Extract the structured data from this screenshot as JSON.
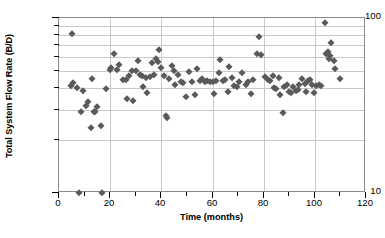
{
  "chart_data": {
    "type": "scatter",
    "title": "",
    "xlabel": "Time (months)",
    "ylabel": "Total System Flow Rate (B/D)",
    "xlim": [
      0,
      120
    ],
    "ylim": [
      10,
      100
    ],
    "yscale": "log",
    "xscale": "linear",
    "grid": true,
    "legend": null,
    "marker": {
      "shape": "diamond",
      "color": "#5a5a5a",
      "size_px": 5.4
    },
    "xticks_major": [
      0,
      20,
      40,
      60,
      80,
      100,
      120
    ],
    "xticks_minor": [
      10,
      30,
      50,
      70,
      90,
      110
    ],
    "yticks_major": [
      10,
      100
    ],
    "yticks_minor": [
      20,
      30,
      40,
      50,
      60,
      70,
      80,
      90
    ],
    "ytick_labels": [
      "10",
      "100"
    ],
    "xtick_labels": [
      "0",
      "20",
      "40",
      "60",
      "80",
      "100",
      "120"
    ],
    "series": [
      {
        "name": "Total System Flow Rate",
        "points": [
          [
            4.5,
            41.0
          ],
          [
            5.0,
            81.0
          ],
          [
            5.5,
            42.5
          ],
          [
            7.0,
            40.0
          ],
          [
            8.0,
            10.0
          ],
          [
            8.5,
            29.0
          ],
          [
            9.5,
            38.5
          ],
          [
            10.5,
            31.5
          ],
          [
            11.5,
            33.0
          ],
          [
            12.5,
            23.5
          ],
          [
            13.0,
            45.0
          ],
          [
            13.5,
            29.0
          ],
          [
            14.0,
            29.0
          ],
          [
            15.0,
            31.0
          ],
          [
            16.5,
            24.0
          ],
          [
            17.0,
            10.0
          ],
          [
            18.5,
            39.5
          ],
          [
            20.0,
            50.5
          ],
          [
            20.5,
            51.5
          ],
          [
            21.5,
            62.0
          ],
          [
            22.5,
            50.5
          ],
          [
            23.5,
            54.0
          ],
          [
            25.0,
            44.5
          ],
          [
            26.0,
            44.0
          ],
          [
            26.5,
            34.5
          ],
          [
            27.5,
            46.5
          ],
          [
            28.5,
            49.5
          ],
          [
            29.0,
            33.5
          ],
          [
            30.0,
            50.0
          ],
          [
            31.0,
            57.0
          ],
          [
            31.5,
            47.5
          ],
          [
            32.5,
            46.5
          ],
          [
            33.0,
            40.5
          ],
          [
            34.0,
            45.5
          ],
          [
            34.5,
            37.5
          ],
          [
            35.5,
            46.0
          ],
          [
            36.5,
            55.0
          ],
          [
            37.0,
            47.0
          ],
          [
            38.0,
            58.0
          ],
          [
            38.5,
            56.0
          ],
          [
            39.0,
            66.0
          ],
          [
            40.0,
            52.0
          ],
          [
            41.0,
            46.5
          ],
          [
            42.0,
            27.5
          ],
          [
            42.3,
            27.0
          ],
          [
            43.0,
            45.0
          ],
          [
            44.0,
            53.5
          ],
          [
            45.0,
            50.0
          ],
          [
            45.5,
            41.5
          ],
          [
            46.5,
            47.5
          ],
          [
            47.5,
            43.0
          ],
          [
            48.5,
            42.5
          ],
          [
            49.5,
            35.5
          ],
          [
            51.0,
            49.0
          ],
          [
            52.0,
            43.0
          ],
          [
            53.0,
            36.5
          ],
          [
            54.0,
            51.0
          ],
          [
            55.0,
            43.5
          ],
          [
            56.0,
            45.0
          ],
          [
            57.0,
            43.0
          ],
          [
            58.0,
            43.5
          ],
          [
            59.0,
            43.0
          ],
          [
            60.0,
            43.0
          ],
          [
            60.5,
            37.0
          ],
          [
            61.5,
            43.5
          ],
          [
            62.5,
            48.5
          ],
          [
            63.0,
            57.5
          ],
          [
            64.0,
            43.5
          ],
          [
            65.0,
            44.0
          ],
          [
            66.0,
            38.0
          ],
          [
            66.5,
            52.5
          ],
          [
            67.5,
            45.5
          ],
          [
            68.5,
            41.0
          ],
          [
            69.5,
            40.5
          ],
          [
            70.5,
            43.0
          ],
          [
            71.5,
            48.5
          ],
          [
            73.0,
            41.5
          ],
          [
            74.0,
            43.0
          ],
          [
            75.0,
            37.0
          ],
          [
            76.0,
            44.5
          ],
          [
            77.5,
            62.5
          ],
          [
            78.0,
            78.0
          ],
          [
            79.0,
            61.5
          ],
          [
            80.5,
            46.0
          ],
          [
            81.5,
            44.0
          ],
          [
            82.5,
            43.5
          ],
          [
            83.5,
            46.5
          ],
          [
            84.0,
            40.0
          ],
          [
            85.0,
            39.5
          ],
          [
            86.0,
            45.5
          ],
          [
            86.5,
            36.5
          ],
          [
            87.5,
            28.5
          ],
          [
            88.0,
            40.5
          ],
          [
            89.0,
            41.5
          ],
          [
            90.0,
            38.0
          ],
          [
            90.5,
            37.5
          ],
          [
            91.5,
            40.5
          ],
          [
            92.5,
            38.5
          ],
          [
            93.5,
            39.0
          ],
          [
            94.0,
            41.5
          ],
          [
            95.0,
            45.0
          ],
          [
            96.0,
            42.0
          ],
          [
            96.5,
            38.0
          ],
          [
            97.5,
            43.5
          ],
          [
            98.0,
            44.0
          ],
          [
            99.0,
            41.5
          ],
          [
            99.5,
            37.5
          ],
          [
            100.5,
            41.0
          ],
          [
            101.5,
            41.5
          ],
          [
            102.5,
            41.0
          ],
          [
            104.0,
            94.0
          ],
          [
            104.5,
            62.5
          ],
          [
            105.0,
            64.0
          ],
          [
            105.5,
            58.0
          ],
          [
            106.0,
            60.5
          ],
          [
            106.5,
            72.0
          ],
          [
            107.5,
            57.0
          ],
          [
            108.0,
            51.0
          ],
          [
            110.0,
            45.0
          ]
        ]
      }
    ]
  }
}
